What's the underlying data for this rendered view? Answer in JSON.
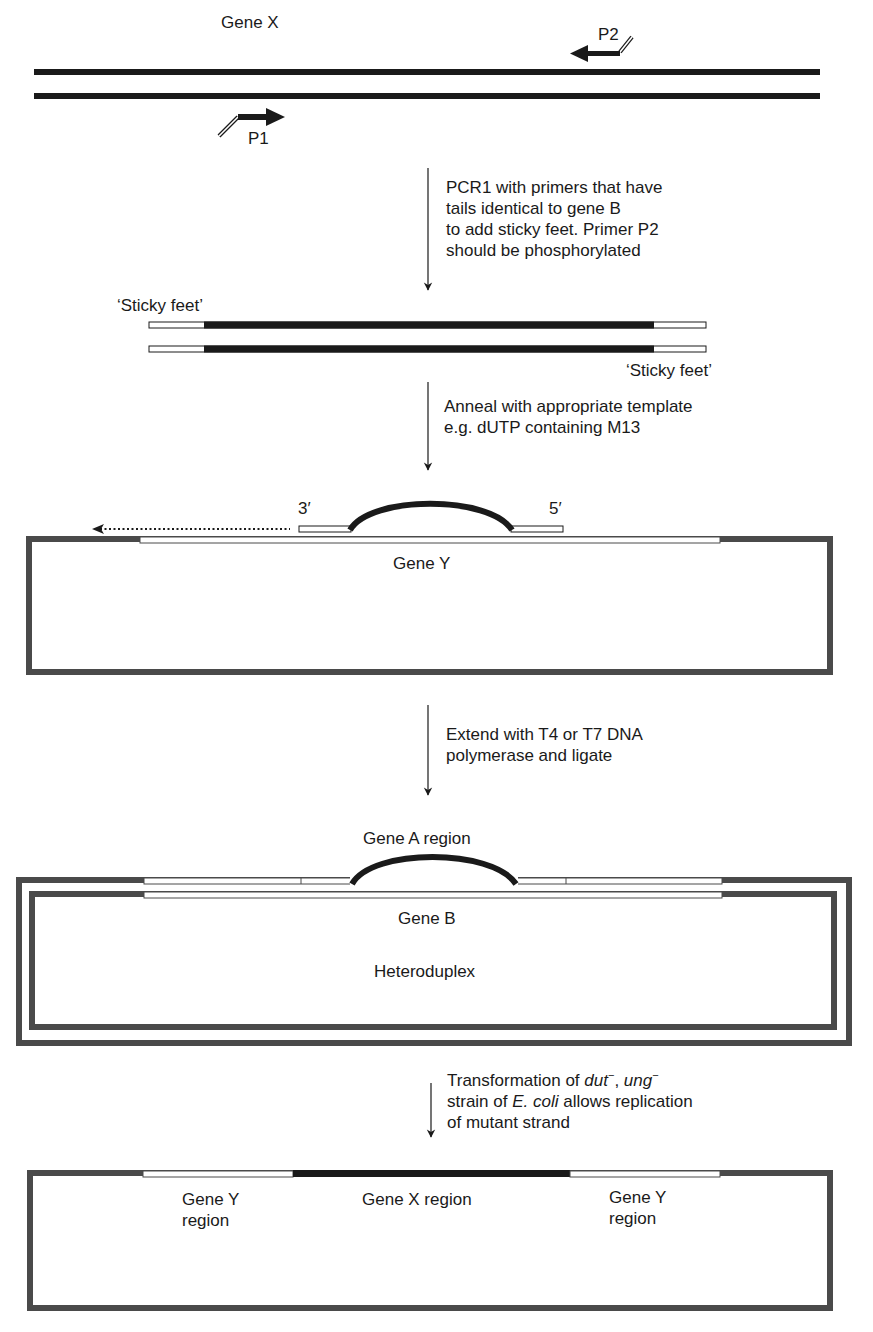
{
  "stage1": {
    "gene_label": "Gene X",
    "primer1": "P1",
    "primer2": "P2"
  },
  "step1": {
    "text": "PCR1 with primers that have\ntails identical to gene B\nto add sticky feet. Primer P2\nshould be phosphorylated"
  },
  "stage2": {
    "sticky_feet_left": "‘Sticky feet’",
    "sticky_feet_right": "‘Sticky feet’"
  },
  "step2": {
    "text": "Anneal with appropriate template\ne.g. dUTP containing M13"
  },
  "stage3": {
    "end_3prime": "3′",
    "end_5prime": "5′",
    "gene_label": "Gene Y"
  },
  "step3": {
    "text": "Extend with T4 or T7 DNA\npolymerase and ligate"
  },
  "stage4": {
    "region_label": "Gene A region",
    "gene_label": "Gene B",
    "structure_label": "Heteroduplex"
  },
  "step4": {
    "line1_prefix": "Transformation of ",
    "dut": "dut",
    "sep": ", ",
    "ung": "ung",
    "minus": "−",
    "line2_prefix": "strain of ",
    "ecoli": "E. coli",
    "line2_suffix": " allows replication",
    "line3": "of mutant strand"
  },
  "stage5": {
    "left_region": "Gene Y\nregion",
    "center_region": "Gene X region",
    "right_region": "Gene Y\nregion"
  },
  "colors": {
    "dna_dark": "#1a1a1a",
    "vector_gray": "#4a4a4a",
    "text": "#1a1a1a",
    "background": "#ffffff"
  }
}
